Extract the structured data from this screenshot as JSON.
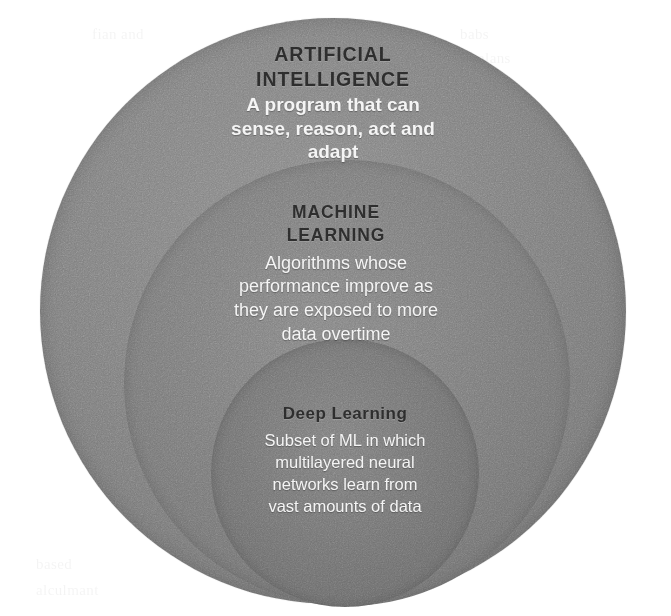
{
  "diagram": {
    "type": "nested-circles",
    "background_color": "#ffffff",
    "layers": [
      {
        "key": "ai",
        "heading_line_1": "ARTIFICIAL",
        "heading_line_2": "INTELLIGENCE",
        "description_line_1": "A program that can",
        "description_line_2": "sense, reason, act and",
        "description_line_3": "adapt",
        "fill_color": "#7c7c7c",
        "heading_color": "#2a2a2a",
        "description_color": "#f4f4f4"
      },
      {
        "key": "ml",
        "heading_line_1": "MACHINE",
        "heading_line_2": "LEARNING",
        "description_line_1": "Algorithms whose",
        "description_line_2": "performance improve as",
        "description_line_3": "they are exposed to more",
        "description_line_4": "data overtime",
        "fill_color": "#777777",
        "heading_color": "#2a2a2a",
        "description_color": "#f4f4f4"
      },
      {
        "key": "dl",
        "heading_line_1": "Deep Learning",
        "description_line_1": "Subset of ML in which",
        "description_line_2": "multilayered neural",
        "description_line_3": "networks learn from",
        "description_line_4": "vast amounts of data",
        "fill_color": "#707070",
        "heading_color": "#2a2a2a",
        "description_color": "#f4f4f4"
      }
    ]
  },
  "background_artifacts": {
    "note": "faint scanner bleed-through text, barely legible",
    "fragments": [
      "fian and",
      "babs",
      "alans",
      "and tha",
      "based",
      "alculmant"
    ]
  }
}
